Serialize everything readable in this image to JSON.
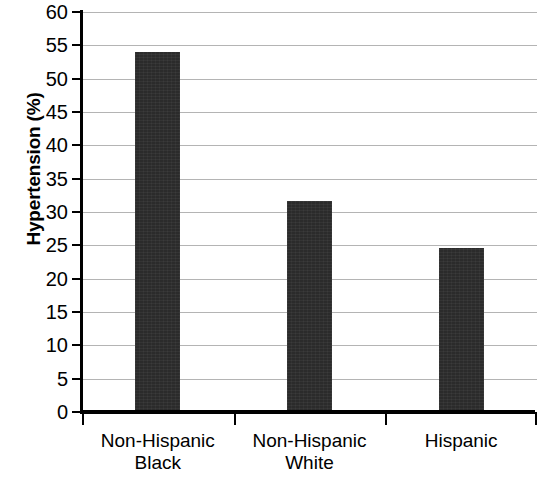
{
  "chart_data": {
    "type": "bar",
    "title": "",
    "subtitle": "",
    "xlabel": "",
    "ylabel": "Hypertension (%)",
    "categories": [
      "Non-Hispanic\nBlack",
      "Non-Hispanic\nWhite",
      "Hispanic"
    ],
    "category_labels_flat": [
      "Non-Hispanic Black",
      "Non-Hispanic White",
      "Hispanic"
    ],
    "values": [
      54.0,
      31.7,
      24.6
    ],
    "ylim": [
      0,
      60
    ],
    "ytick_step": 5,
    "yticks": [
      0,
      5,
      10,
      15,
      20,
      25,
      30,
      35,
      40,
      45,
      50,
      55,
      60
    ],
    "ytick_labels": [
      "0",
      "5",
      "10",
      "15",
      "20",
      "25",
      "30",
      "35",
      "40",
      "45",
      "50",
      "55",
      "60"
    ],
    "grid": true,
    "grid_axis": "y",
    "legend": false,
    "legend_position": "none",
    "bar_color": "#2b2b2b",
    "grid_color": "#b4b4b4",
    "axis_color": "#000000",
    "background_color": "#ffffff"
  },
  "figure": {
    "y_axis_title": "Hypertension (%)"
  }
}
